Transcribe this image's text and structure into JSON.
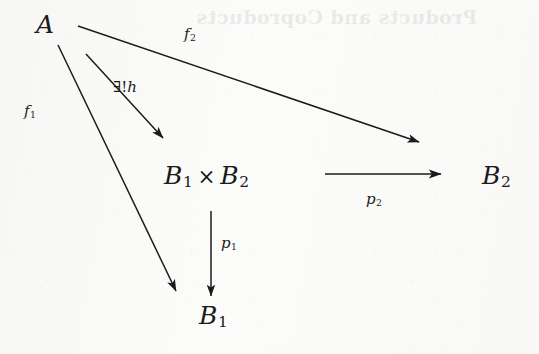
{
  "diagram": {
    "background_color": "#fbfbfa",
    "ink_color": "#1b1b1b",
    "nodes": [
      {
        "id": "a",
        "name": "object-a",
        "label": "A",
        "x": 46,
        "y": 27
      },
      {
        "id": "product",
        "name": "object-product",
        "label_base_1": "B",
        "label_sub_1": "1",
        "times": "×",
        "label_base_2": "B",
        "label_sub_2": "2",
        "x": 214,
        "y": 178
      },
      {
        "id": "b1",
        "name": "object-b1",
        "label_base": "B",
        "label_sub": "1",
        "x": 212,
        "y": 318
      },
      {
        "id": "b2",
        "name": "object-b2",
        "label_base": "B",
        "label_sub": "2",
        "x": 498,
        "y": 178
      }
    ],
    "edges": [
      {
        "id": "f1",
        "name": "morphism-f1",
        "from": "a",
        "to": "b1",
        "label_base": "f",
        "label_sub": "1",
        "label_x": 33,
        "label_y": 112,
        "x1": 58,
        "y1": 45,
        "x2": 176,
        "y2": 291
      },
      {
        "id": "f2",
        "name": "morphism-f2",
        "from": "a",
        "to": "b2",
        "label_base": "f",
        "label_sub": "2",
        "label_x": 192,
        "label_y": 35,
        "x1": 78,
        "y1": 26,
        "x2": 419,
        "y2": 142
      },
      {
        "id": "h",
        "name": "morphism-unique-h",
        "from": "a",
        "to": "product",
        "quantifier": "∃!",
        "label_base": "h",
        "label_x": 120,
        "label_y": 88,
        "x1": 86,
        "y1": 54,
        "x2": 163,
        "y2": 138
      },
      {
        "id": "p1",
        "name": "projection-p1",
        "from": "product",
        "to": "b1",
        "label_base": "p",
        "label_sub": "1",
        "label_x": 228,
        "label_y": 244,
        "x1": 211,
        "y1": 211,
        "x2": 211,
        "y2": 296
      },
      {
        "id": "p2",
        "name": "projection-p2",
        "from": "product",
        "to": "b2",
        "label_base": "p",
        "label_sub": "2",
        "label_x": 373,
        "label_y": 200,
        "x1": 325,
        "y1": 174,
        "x2": 441,
        "y2": 174
      }
    ],
    "bleed_through": {
      "heading": "Products and Coproducts",
      "subline": "reverse-page ghosting"
    }
  }
}
